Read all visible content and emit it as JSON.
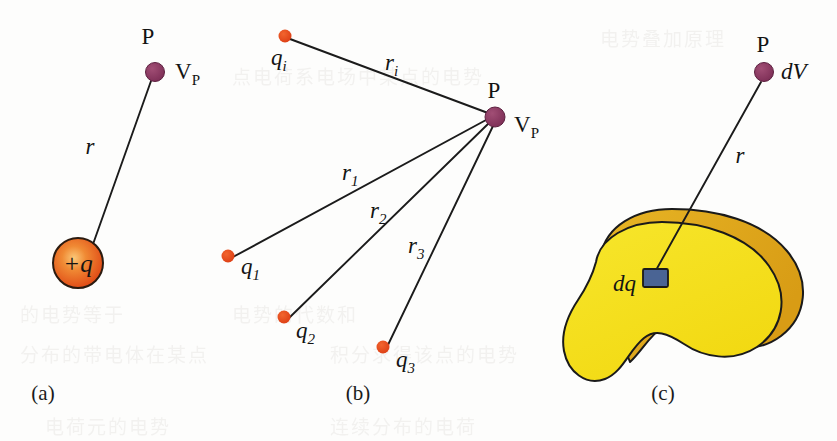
{
  "figure": {
    "background_color": "#fdfdfc",
    "line_color": "#1b1b1b"
  },
  "colors": {
    "positive_charge_orange": "#e8501e",
    "positive_charge_highlight": "#f6a03a",
    "point_charge_dot": "#e2461b",
    "field_point_purple": "#8e3a63",
    "blob_face_yellow": "#f5e020",
    "blob_rim_gold": "#e0a81e",
    "dq_blue": "#4a6494",
    "outline_dark": "#1a1a1a",
    "bleed_through_gray": "#d9d7d4"
  },
  "panels": [
    {
      "id": "a",
      "caption": "(a)",
      "description": "Potential at point P due to a single positive point charge +q at distance r",
      "source_charge": {
        "label": "+q",
        "shape": "shaded-sphere"
      },
      "field_point": {
        "point_label": "P",
        "potential_label": "V_P"
      },
      "distance_label": "r"
    },
    {
      "id": "b",
      "caption": "(b)",
      "description": "Potential at point P due to a group of discrete point charges",
      "field_point": {
        "point_label": "P",
        "potential_label": "V_P"
      },
      "charges": [
        {
          "charge_label": "q_i",
          "distance_label": "r_i"
        },
        {
          "charge_label": "q_1",
          "distance_label": "r_1"
        },
        {
          "charge_label": "q_2",
          "distance_label": "r_2"
        },
        {
          "charge_label": "q_3",
          "distance_label": "r_3"
        }
      ]
    },
    {
      "id": "c",
      "caption": "(c)",
      "description": "Potential at point P due to a continuous charge distribution; element dq contributes dV",
      "field_point": {
        "point_label": "P",
        "potential_label": "dV"
      },
      "charge_element_label": "dq",
      "distance_label": "r",
      "body_shape": "irregular solid blob"
    }
  ],
  "subscripts": {
    "V_P": {
      "base": "V",
      "sub": "P"
    },
    "q_i": {
      "base": "q",
      "sub": "i"
    },
    "q_1": {
      "base": "q",
      "sub": "1"
    },
    "q_2": {
      "base": "q",
      "sub": "2"
    },
    "q_3": {
      "base": "q",
      "sub": "3"
    },
    "r_i": {
      "base": "r",
      "sub": "i"
    },
    "r_1": {
      "base": "r",
      "sub": "1"
    },
    "r_2": {
      "base": "r",
      "sub": "2"
    },
    "r_3": {
      "base": "r",
      "sub": "3"
    }
  },
  "plain_labels": {
    "P": "P",
    "r": "r",
    "plus_q": "+q",
    "dq": "dq",
    "dV": "dV",
    "cap_a": "(a)",
    "cap_b": "(b)",
    "cap_c": "(c)"
  },
  "bleed_through": [
    {
      "text": "电势叠加原理",
      "x": 600,
      "y": 24,
      "size": 19
    },
    {
      "text": "点电荷系电场中某点的电势",
      "x": 232,
      "y": 62,
      "size": 19
    },
    {
      "text": "的电势等于",
      "x": 20,
      "y": 300,
      "size": 19
    },
    {
      "text": "电势的代数和",
      "x": 232,
      "y": 300,
      "size": 19
    },
    {
      "text": "分布的带电体在某点",
      "x": 20,
      "y": 340,
      "size": 19
    },
    {
      "text": "积分求得该点的电势",
      "x": 330,
      "y": 340,
      "size": 19
    },
    {
      "text": "电荷元的电势",
      "x": 45,
      "y": 412,
      "size": 19
    },
    {
      "text": "连续分布的电荷",
      "x": 330,
      "y": 412,
      "size": 19
    }
  ]
}
